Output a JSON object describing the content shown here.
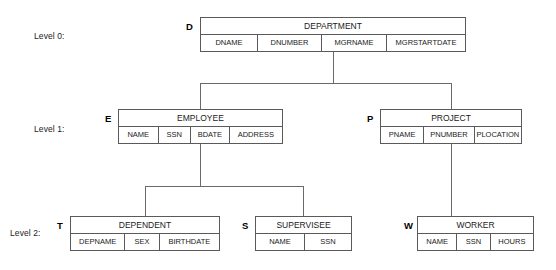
{
  "diagram": {
    "levels": [
      {
        "label": "Level 0:"
      },
      {
        "label": "Level 1:"
      },
      {
        "label": "Level 2:"
      }
    ],
    "records": [
      {
        "tag": "D",
        "name": "DEPARTMENT",
        "level": 0,
        "fields": [
          "DNAME",
          "DNUMBER",
          "MGRNAME",
          "MGRSTARTDATE"
        ]
      },
      {
        "tag": "E",
        "name": "EMPLOYEE",
        "level": 1,
        "fields": [
          "NAME",
          "SSN",
          "BDATE",
          "ADDRESS"
        ]
      },
      {
        "tag": "P",
        "name": "PROJECT",
        "level": 1,
        "fields": [
          "PNAME",
          "PNUMBER",
          "PLOCATION"
        ]
      },
      {
        "tag": "T",
        "name": "DEPENDENT",
        "level": 2,
        "fields": [
          "DEPNAME",
          "SEX",
          "BIRTHDATE"
        ]
      },
      {
        "tag": "S",
        "name": "SUPERVISEE",
        "level": 2,
        "fields": [
          "NAME",
          "SSN"
        ]
      },
      {
        "tag": "W",
        "name": "WORKER",
        "level": 2,
        "fields": [
          "NAME",
          "SSN",
          "HOURS"
        ]
      }
    ],
    "relationships": [
      {
        "parent": "DEPARTMENT",
        "child": "EMPLOYEE"
      },
      {
        "parent": "DEPARTMENT",
        "child": "PROJECT"
      },
      {
        "parent": "EMPLOYEE",
        "child": "DEPENDENT"
      },
      {
        "parent": "EMPLOYEE",
        "child": "SUPERVISEE"
      },
      {
        "parent": "PROJECT",
        "child": "WORKER"
      }
    ],
    "colors": {
      "background": "#ffffff",
      "border": "#5a5a5a",
      "line": "#6a6a6a",
      "text": "#1a1a1a"
    }
  }
}
